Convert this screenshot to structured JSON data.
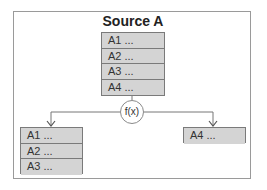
{
  "diagram": {
    "source": {
      "title": "Source A",
      "rows": [
        "A1  ...",
        "A2  ...",
        "A3  ...",
        "A4  ..."
      ]
    },
    "function_label": "f(x)",
    "left_output": {
      "rows": [
        "A1  ...",
        "A2  ...",
        "A3  ..."
      ]
    },
    "right_output": {
      "rows": [
        "A4  ..."
      ]
    },
    "colors": {
      "row_fill": "#d4d4d4",
      "border": "#7a7a7a",
      "frame": "#9a9a9a"
    }
  }
}
